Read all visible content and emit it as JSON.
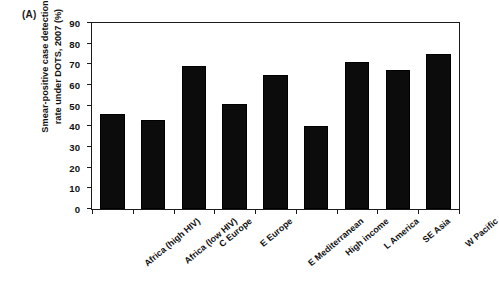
{
  "panel": {
    "label": "(A)"
  },
  "chart_data": {
    "type": "bar",
    "title": "",
    "xlabel": "",
    "ylabel": "Smear-positive case detection rate under DOTS, 2007 (%)",
    "ylabel_lines": [
      "Smear-positive case detection",
      "rate under DOTS, 2007 (%)"
    ],
    "ylim": [
      0,
      90
    ],
    "yticks": [
      0,
      10,
      20,
      30,
      40,
      50,
      60,
      70,
      80,
      90
    ],
    "ytick_labels": [
      "0",
      "10",
      "20",
      "30",
      "40",
      "50",
      "60",
      "70",
      "80",
      "90"
    ],
    "grid": false,
    "legend": null,
    "bar_color": "#0c0c0c",
    "categories": [
      "Africa (high HIV)",
      "Africa (low HIV)",
      "C Europe",
      "E Europe",
      "E Mediterranean",
      "High income",
      "L America",
      "SE Asia",
      "W Pacific"
    ],
    "values": [
      46,
      43,
      69,
      51,
      65,
      40,
      71,
      67.5,
      75
    ]
  }
}
